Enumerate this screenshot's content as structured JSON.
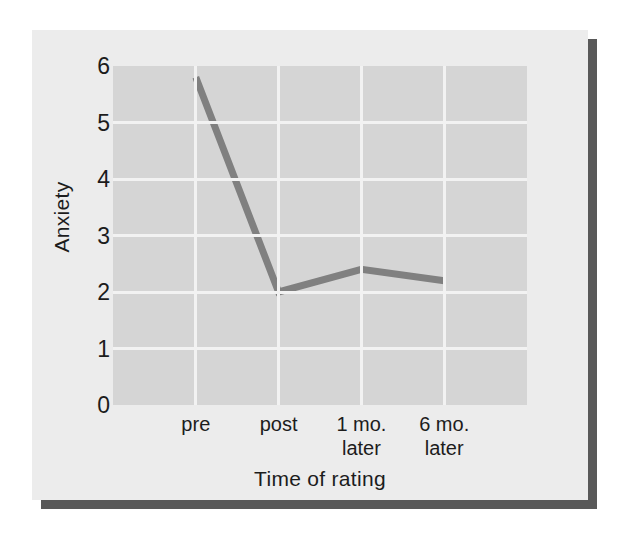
{
  "figure": {
    "background_color": "#ececec",
    "shadow_color": "#595959",
    "plot_background_color": "#d5d5d5",
    "gridline_color": "#f2f2f2",
    "line_color": "#808080",
    "text_color": "#1c1c1c"
  },
  "chart_data": {
    "type": "line",
    "title": "",
    "xlabel": "Time of rating",
    "ylabel": "Anxiety",
    "categories": [
      "pre",
      "post",
      "1 mo. later",
      "6 mo. later"
    ],
    "category_lines": [
      [
        "pre",
        ""
      ],
      [
        "post",
        ""
      ],
      [
        "1 mo.",
        "later"
      ],
      [
        "6 mo.",
        "later"
      ]
    ],
    "values": [
      5.8,
      2.0,
      2.4,
      2.2
    ],
    "series": [
      {
        "name": "Anxiety",
        "values": [
          5.8,
          2.0,
          2.4,
          2.2
        ]
      }
    ],
    "ylim": [
      0,
      6
    ],
    "yticks": [
      0,
      1,
      2,
      3,
      4,
      5,
      6
    ],
    "ytick_labels": [
      "0",
      "1",
      "2",
      "3",
      "4",
      "5",
      "6"
    ],
    "grid": true,
    "grid_axis": "both",
    "legend": "none",
    "line_width": 7,
    "markers": "none"
  }
}
